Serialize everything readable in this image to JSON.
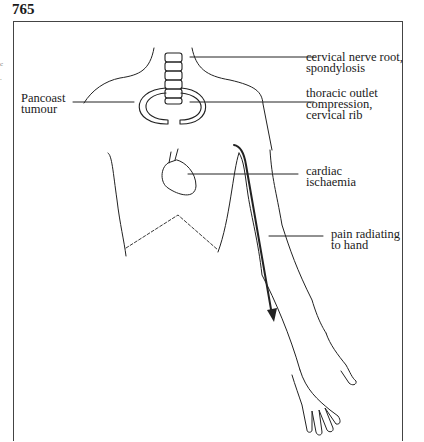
{
  "figure": {
    "number": "765",
    "edge_marks": [
      "c",
      "."
    ]
  },
  "labels": {
    "cervical": [
      "cervical nerve root,",
      "spondylosis"
    ],
    "thoracic": [
      "thoracic outlet",
      "compression,",
      "cervical rib"
    ],
    "pancoast": [
      "Pancoast",
      "tumour"
    ],
    "cardiac": [
      "cardiac",
      "ischaemia"
    ],
    "radiating": [
      "pain radiating",
      "to hand"
    ]
  },
  "colors": {
    "line": "#222222",
    "frame": "#444444",
    "background": "#ffffff"
  }
}
